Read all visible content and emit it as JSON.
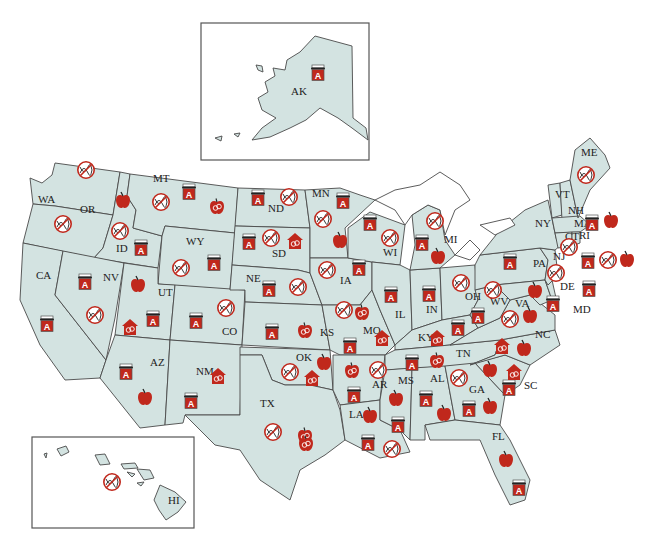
{
  "map": {
    "title": "",
    "colors": {
      "land": "#d3e3e1",
      "border": "#4a4a4a",
      "icon_red": "#c0281c",
      "icon_dark": "#222222",
      "background": "#ffffff"
    },
    "icon_types": {
      "no-dna": "Red circle with slash over DNA helix",
      "grade-a": "Report card / book with letter A",
      "apple": "Red apple",
      "apple-gender": "Apple with gender symbols",
      "schoolhouse-gender": "Red schoolhouse with gender symbols"
    },
    "insets": {
      "alaska": {
        "label": "AK"
      },
      "hawaii": {
        "label": "HI"
      }
    },
    "state_labels": [
      {
        "id": "WA",
        "x": 38,
        "y": 203
      },
      {
        "id": "OR",
        "x": 80,
        "y": 213
      },
      {
        "id": "CA",
        "x": 36,
        "y": 279
      },
      {
        "id": "ID",
        "x": 116,
        "y": 252
      },
      {
        "id": "NV",
        "x": 103,
        "y": 281
      },
      {
        "id": "MT",
        "x": 153,
        "y": 182
      },
      {
        "id": "WY",
        "x": 186,
        "y": 245
      },
      {
        "id": "UT",
        "x": 158,
        "y": 296
      },
      {
        "id": "AZ",
        "x": 150,
        "y": 366
      },
      {
        "id": "CO",
        "x": 222,
        "y": 335
      },
      {
        "id": "NM",
        "x": 196,
        "y": 375
      },
      {
        "id": "ND",
        "x": 268,
        "y": 212
      },
      {
        "id": "SD",
        "x": 272,
        "y": 257
      },
      {
        "id": "NE",
        "x": 246,
        "y": 282
      },
      {
        "id": "KS",
        "x": 320,
        "y": 336
      },
      {
        "id": "OK",
        "x": 296,
        "y": 361
      },
      {
        "id": "TX",
        "x": 260,
        "y": 407
      },
      {
        "id": "MN",
        "x": 312,
        "y": 197
      },
      {
        "id": "IA",
        "x": 340,
        "y": 284
      },
      {
        "id": "MO",
        "x": 363,
        "y": 334
      },
      {
        "id": "AR",
        "x": 372,
        "y": 388
      },
      {
        "id": "LA",
        "x": 349,
        "y": 418
      },
      {
        "id": "WI",
        "x": 383,
        "y": 256
      },
      {
        "id": "IL",
        "x": 395,
        "y": 318
      },
      {
        "id": "MI",
        "x": 444,
        "y": 243
      },
      {
        "id": "IN",
        "x": 426,
        "y": 313
      },
      {
        "id": "OH",
        "x": 465,
        "y": 300
      },
      {
        "id": "KY",
        "x": 418,
        "y": 341
      },
      {
        "id": "TN",
        "x": 456,
        "y": 357
      },
      {
        "id": "MS",
        "x": 398,
        "y": 384
      },
      {
        "id": "AL",
        "x": 430,
        "y": 382
      },
      {
        "id": "GA",
        "x": 469,
        "y": 393
      },
      {
        "id": "FL",
        "x": 492,
        "y": 440
      },
      {
        "id": "SC",
        "x": 524,
        "y": 389
      },
      {
        "id": "NC",
        "x": 535,
        "y": 338
      },
      {
        "id": "VA",
        "x": 515,
        "y": 307
      },
      {
        "id": "WV",
        "x": 490,
        "y": 305
      },
      {
        "id": "PA",
        "x": 533,
        "y": 267
      },
      {
        "id": "NY",
        "x": 535,
        "y": 227
      },
      {
        "id": "MD",
        "x": 573,
        "y": 313
      },
      {
        "id": "DE",
        "x": 560,
        "y": 290
      },
      {
        "id": "NJ",
        "x": 553,
        "y": 260
      },
      {
        "id": "VT",
        "x": 555,
        "y": 198
      },
      {
        "id": "NH",
        "x": 568,
        "y": 214
      },
      {
        "id": "MA",
        "x": 574,
        "y": 227
      },
      {
        "id": "CT",
        "x": 565,
        "y": 240
      },
      {
        "id": "RI",
        "x": 579,
        "y": 239
      },
      {
        "id": "ME",
        "x": 581,
        "y": 156
      },
      {
        "id": "AK",
        "x": 291,
        "y": 95
      },
      {
        "id": "HI",
        "x": 168,
        "y": 504
      }
    ],
    "icons": [
      {
        "state": "AK",
        "type": "grade-a",
        "x": 318,
        "y": 72
      },
      {
        "state": "WA",
        "type": "no-dna",
        "x": 86,
        "y": 170
      },
      {
        "state": "OR",
        "type": "no-dna",
        "x": 63,
        "y": 224
      },
      {
        "state": "ID",
        "type": "apple",
        "x": 123,
        "y": 200
      },
      {
        "state": "ID",
        "type": "no-dna",
        "x": 120,
        "y": 231
      },
      {
        "state": "ID",
        "type": "grade-a",
        "x": 141,
        "y": 247
      },
      {
        "state": "MT",
        "type": "no-dna",
        "x": 161,
        "y": 202
      },
      {
        "state": "MT",
        "type": "grade-a",
        "x": 189,
        "y": 191
      },
      {
        "state": "MT",
        "type": "apple-gender",
        "x": 217,
        "y": 206
      },
      {
        "state": "NV",
        "type": "grade-a",
        "x": 85,
        "y": 281
      },
      {
        "state": "NV",
        "type": "no-dna",
        "x": 95,
        "y": 315
      },
      {
        "state": "CA",
        "type": "grade-a",
        "x": 47,
        "y": 323
      },
      {
        "state": "UT",
        "type": "apple",
        "x": 138,
        "y": 284
      },
      {
        "state": "UT",
        "type": "schoolhouse-gender",
        "x": 130,
        "y": 327
      },
      {
        "state": "UT",
        "type": "grade-a",
        "x": 153,
        "y": 318
      },
      {
        "state": "AZ",
        "type": "grade-a",
        "x": 126,
        "y": 371
      },
      {
        "state": "AZ",
        "type": "apple",
        "x": 145,
        "y": 397
      },
      {
        "state": "WY",
        "type": "no-dna",
        "x": 181,
        "y": 268
      },
      {
        "state": "WY",
        "type": "grade-a",
        "x": 214,
        "y": 262
      },
      {
        "state": "CO",
        "type": "no-dna",
        "x": 226,
        "y": 308
      },
      {
        "state": "CO",
        "type": "grade-a",
        "x": 196,
        "y": 320
      },
      {
        "state": "NM",
        "type": "schoolhouse-gender",
        "x": 218,
        "y": 376
      },
      {
        "state": "NM",
        "type": "grade-a",
        "x": 191,
        "y": 400
      },
      {
        "state": "ND",
        "type": "grade-a",
        "x": 258,
        "y": 197
      },
      {
        "state": "ND",
        "type": "no-dna",
        "x": 289,
        "y": 197
      },
      {
        "state": "SD",
        "type": "grade-a",
        "x": 249,
        "y": 241
      },
      {
        "state": "SD",
        "type": "no-dna",
        "x": 271,
        "y": 238
      },
      {
        "state": "SD",
        "type": "schoolhouse-gender",
        "x": 295,
        "y": 241
      },
      {
        "state": "NE",
        "type": "grade-a",
        "x": 269,
        "y": 288
      },
      {
        "state": "NE",
        "type": "no-dna",
        "x": 298,
        "y": 287
      },
      {
        "state": "MN",
        "type": "grade-a",
        "x": 343,
        "y": 200
      },
      {
        "state": "MN",
        "type": "no-dna",
        "x": 323,
        "y": 219
      },
      {
        "state": "MN",
        "type": "apple",
        "x": 340,
        "y": 240
      },
      {
        "state": "WI",
        "type": "grade-a",
        "x": 370,
        "y": 222
      },
      {
        "state": "WI",
        "type": "no-dna",
        "x": 390,
        "y": 238
      },
      {
        "state": "MI",
        "type": "no-dna",
        "x": 435,
        "y": 221
      },
      {
        "state": "MI",
        "type": "grade-a",
        "x": 422,
        "y": 242
      },
      {
        "state": "MI",
        "type": "apple",
        "x": 438,
        "y": 256
      },
      {
        "state": "IA",
        "type": "no-dna",
        "x": 327,
        "y": 270
      },
      {
        "state": "IA",
        "type": "grade-a",
        "x": 359,
        "y": 267
      },
      {
        "state": "KS",
        "type": "grade-a",
        "x": 272,
        "y": 331
      },
      {
        "state": "KS",
        "type": "apple-gender",
        "x": 305,
        "y": 330
      },
      {
        "state": "MO",
        "type": "no-dna",
        "x": 344,
        "y": 310
      },
      {
        "state": "MO",
        "type": "apple-gender",
        "x": 362,
        "y": 312
      },
      {
        "state": "MO",
        "type": "schoolhouse-gender",
        "x": 382,
        "y": 338
      },
      {
        "state": "MO",
        "type": "grade-a",
        "x": 350,
        "y": 345
      },
      {
        "state": "IL",
        "type": "grade-a",
        "x": 391,
        "y": 294
      },
      {
        "state": "IN",
        "type": "grade-a",
        "x": 429,
        "y": 293
      },
      {
        "state": "OH",
        "type": "no-dna",
        "x": 461,
        "y": 283
      },
      {
        "state": "OK",
        "type": "no-dna",
        "x": 290,
        "y": 372
      },
      {
        "state": "OK",
        "type": "schoolhouse-gender",
        "x": 312,
        "y": 378
      },
      {
        "state": "OK",
        "type": "apple",
        "x": 324,
        "y": 362
      },
      {
        "state": "TX",
        "type": "no-dna",
        "x": 273,
        "y": 432
      },
      {
        "state": "TX",
        "type": "apple-gender",
        "x": 305,
        "y": 435
      },
      {
        "state": "TX",
        "type": "apple-gender",
        "x": 306,
        "y": 443
      },
      {
        "state": "AR",
        "type": "apple-gender",
        "x": 352,
        "y": 370
      },
      {
        "state": "AR",
        "type": "no-dna",
        "x": 378,
        "y": 370
      },
      {
        "state": "AR",
        "type": "grade-a",
        "x": 354,
        "y": 394
      },
      {
        "state": "LA",
        "type": "apple",
        "x": 370,
        "y": 415
      },
      {
        "state": "LA",
        "type": "grade-a",
        "x": 368,
        "y": 442
      },
      {
        "state": "LA",
        "type": "no-dna",
        "x": 392,
        "y": 449
      },
      {
        "state": "MS",
        "type": "apple",
        "x": 396,
        "y": 398
      },
      {
        "state": "MS",
        "type": "grade-a",
        "x": 398,
        "y": 424
      },
      {
        "state": "KY",
        "type": "schoolhouse-gender",
        "x": 437,
        "y": 338
      },
      {
        "state": "KY",
        "type": "grade-a",
        "x": 458,
        "y": 327
      },
      {
        "state": "TN",
        "type": "grade-a",
        "x": 412,
        "y": 362
      },
      {
        "state": "TN",
        "type": "apple-gender",
        "x": 437,
        "y": 360
      },
      {
        "state": "AL",
        "type": "grade-a",
        "x": 426,
        "y": 398
      },
      {
        "state": "AL",
        "type": "apple",
        "x": 444,
        "y": 413
      },
      {
        "state": "GA",
        "type": "no-dna",
        "x": 459,
        "y": 378
      },
      {
        "state": "GA",
        "type": "grade-a",
        "x": 469,
        "y": 408
      },
      {
        "state": "GA",
        "type": "apple",
        "x": 490,
        "y": 406
      },
      {
        "state": "SC",
        "type": "grade-a",
        "x": 509,
        "y": 387
      },
      {
        "state": "FL",
        "type": "apple",
        "x": 506,
        "y": 459
      },
      {
        "state": "FL",
        "type": "grade-a",
        "x": 519,
        "y": 487
      },
      {
        "state": "WV",
        "type": "no-dna",
        "x": 493,
        "y": 290
      },
      {
        "state": "WV",
        "type": "grade-a",
        "x": 478,
        "y": 315
      },
      {
        "state": "VA",
        "type": "no-dna",
        "x": 510,
        "y": 319
      },
      {
        "state": "VA",
        "type": "apple",
        "x": 530,
        "y": 315
      },
      {
        "state": "NC",
        "type": "schoolhouse-gender",
        "x": 502,
        "y": 346
      },
      {
        "state": "NC",
        "type": "apple",
        "x": 524,
        "y": 348
      },
      {
        "state": "NC",
        "type": "schoolhouse-gender",
        "x": 514,
        "y": 372
      },
      {
        "state": "NC",
        "type": "apple",
        "x": 490,
        "y": 369
      },
      {
        "state": "PA",
        "type": "grade-a",
        "x": 510,
        "y": 261
      },
      {
        "state": "PA",
        "type": "apple",
        "x": 535,
        "y": 290
      },
      {
        "state": "NJ",
        "type": "no-dna",
        "x": 556,
        "y": 273
      },
      {
        "state": "MD",
        "type": "grade-a",
        "x": 553,
        "y": 303
      },
      {
        "state": "DE",
        "type": "grade-a",
        "x": 589,
        "y": 288
      },
      {
        "state": "CT",
        "type": "no-dna",
        "x": 569,
        "y": 247
      },
      {
        "state": "RI",
        "type": "grade-a",
        "x": 588,
        "y": 260
      },
      {
        "state": "RI",
        "type": "no-dna",
        "x": 608,
        "y": 260
      },
      {
        "state": "RI",
        "type": "apple",
        "x": 627,
        "y": 259
      },
      {
        "state": "MA",
        "type": "grade-a",
        "x": 592,
        "y": 222
      },
      {
        "state": "MA",
        "type": "apple",
        "x": 611,
        "y": 220
      },
      {
        "state": "ME",
        "type": "no-dna",
        "x": 586,
        "y": 175
      },
      {
        "state": "HI",
        "type": "no-dna",
        "x": 112,
        "y": 482
      }
    ]
  }
}
